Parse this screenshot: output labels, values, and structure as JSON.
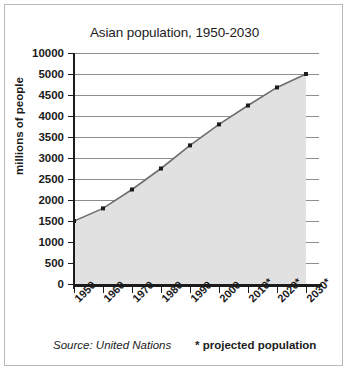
{
  "chart_data": {
    "type": "area",
    "title": "Asian population, 1950-2030",
    "xlabel": "",
    "ylabel": "millions of people",
    "categories": [
      "1950",
      "1960",
      "1970",
      "1980",
      "1990",
      "2000",
      "2010*",
      "2020*",
      "2030*"
    ],
    "values": [
      1500,
      1800,
      2250,
      2750,
      3300,
      3800,
      4250,
      4680,
      5000
    ],
    "yticks": [
      0,
      500,
      1000,
      1500,
      2000,
      2500,
      3000,
      3500,
      4000,
      4500,
      5000,
      10000
    ],
    "ytick_labels": [
      "0",
      "500",
      "1000",
      "1500",
      "2000",
      "2500",
      "3000",
      "3500",
      "4000",
      "4500",
      "5000",
      "10000"
    ],
    "ylim": [
      0,
      10000
    ],
    "grid": true,
    "legend_position": "none",
    "annotations": [
      "Source: United Nations",
      "* projected population"
    ],
    "colors": {
      "line": "#6e6e6e",
      "marker": "#1c1c1c",
      "fill": "#e1e1e1",
      "grid": "#8e8e8e",
      "axis": "#1c1c1c",
      "background": "#ffffff",
      "border": "#b9b9b9"
    }
  },
  "footer": {
    "source": "Source: United Nations",
    "projected": "* projected population"
  }
}
